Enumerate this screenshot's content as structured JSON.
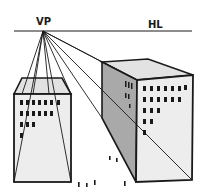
{
  "labels": {
    "vanishing_point": "VP",
    "horizon_line": "HL"
  },
  "colors": {
    "ink": "#1a1a1a",
    "background": "#ffffff",
    "face_light": "#ececec",
    "face_top": "#e2e2e2",
    "face_side": "#a9a9a9"
  },
  "diagram": {
    "type": "one-point perspective",
    "vanishing_point": {
      "x": 43,
      "y": 31
    },
    "horizon_y": 31,
    "buildings": [
      {
        "name": "left-building",
        "windows_rows": [
          7,
          6,
          3,
          1
        ]
      },
      {
        "name": "right-building",
        "windows_rows": [
          7,
          6,
          3,
          2,
          1
        ]
      }
    ]
  }
}
